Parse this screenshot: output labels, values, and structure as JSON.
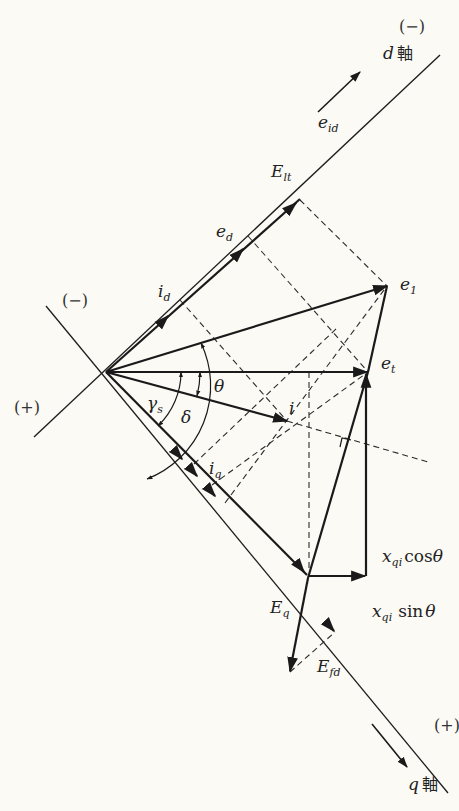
{
  "figure": {
    "type": "phasor-diagram",
    "axes": {
      "d_axis": {
        "label_var": "d",
        "label_suffix": "軸",
        "sign_top": "(−)",
        "sign_left": "(−)"
      },
      "q_axis": {
        "label_var": "q",
        "label_suffix": "軸",
        "sign_bottom": "(+)",
        "sign_left": "(+)"
      }
    },
    "labels": {
      "e_id": {
        "main": "e",
        "sub": "id"
      },
      "E_lt": {
        "main": "E",
        "sub": "lt"
      },
      "e_d": {
        "main": "e",
        "sub": "d"
      },
      "i_d": {
        "main": "i",
        "sub": "d"
      },
      "e_1": {
        "main": "e",
        "sub": "1"
      },
      "e_t": {
        "main": "e",
        "sub": "t"
      },
      "theta": "θ",
      "gamma_s": {
        "main": "γ",
        "sub": "s"
      },
      "delta": "δ",
      "i": "i",
      "i_q": {
        "main": "i",
        "sub": "q"
      },
      "x_qi_cos": {
        "var": "x",
        "sub": "qi",
        "fn": "cos",
        "arg": "θ"
      },
      "x_qi_sin": {
        "var": "x",
        "sub": "qi",
        "fn": "sin",
        "arg": "θ"
      },
      "E_q": {
        "main": "E",
        "sub": "q"
      },
      "E_fd": {
        "main": "E",
        "sub": "fd"
      }
    }
  }
}
